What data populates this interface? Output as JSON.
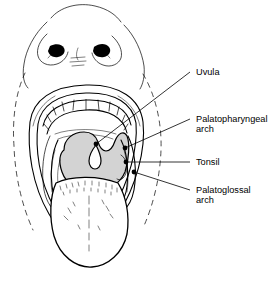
{
  "figure": {
    "background_color": "#ffffff",
    "ink_color": "#000000",
    "palate_fill_color": "#d3d3d3",
    "tongue_fill_color": "#ffffff"
  },
  "labels": [
    {
      "id": "uvula",
      "text": "Uvula",
      "text_x": 196,
      "text_y": 75,
      "leader": "M 190,72 L 96,144",
      "dot_x": 96,
      "dot_y": 144
    },
    {
      "id": "palatopharyngeal-arch",
      "text_line1": "Palatopharyngeal",
      "text_line2": "arch",
      "text_x": 196,
      "text_y": 122,
      "text2_y": 132,
      "leader": "M 190,119 L 125,148",
      "dot_x": 125,
      "dot_y": 148
    },
    {
      "id": "tonsil",
      "text": "Tonsil",
      "text_x": 196,
      "text_y": 165,
      "leader": "M 190,162 L 126,162",
      "dot_x": 126,
      "dot_y": 162
    },
    {
      "id": "palatoglossal-arch",
      "text_line1": "Palatoglossal",
      "text_line2": "arch",
      "text_x": 196,
      "text_y": 193,
      "text2_y": 203,
      "leader": "M 190,190 L 134,172",
      "dot_x": 134,
      "dot_y": 172
    }
  ],
  "anatomy_parts": [
    {
      "id": "face-outline",
      "name": "face-and-chin-outline"
    },
    {
      "id": "nose",
      "name": "nose-with-nostrils"
    },
    {
      "id": "upper-lip",
      "name": "upper-lip"
    },
    {
      "id": "lower-lip",
      "name": "lower-lip"
    },
    {
      "id": "upper-teeth",
      "name": "upper-teeth-arch"
    },
    {
      "id": "soft-palate",
      "name": "soft-palate"
    },
    {
      "id": "uvula",
      "name": "uvula"
    },
    {
      "id": "tongue",
      "name": "tongue"
    },
    {
      "id": "tonsil",
      "name": "tonsil"
    },
    {
      "id": "palatoglossal-arch",
      "name": "palatoglossal-arch"
    },
    {
      "id": "palatopharyngeal-arch",
      "name": "palatopharyngeal-arch"
    }
  ]
}
